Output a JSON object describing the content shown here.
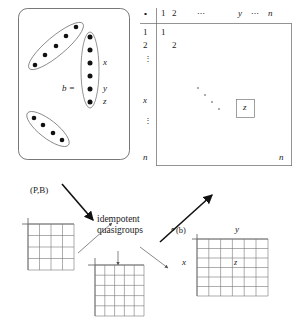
{
  "figure": {
    "colors": {
      "ink": "#1a1a1a",
      "line": "#555555",
      "grid": "#777777",
      "faint": "#999999",
      "background": "#ffffff"
    }
  },
  "left_panel": {
    "name": "point-block-design-panel",
    "b_label": "b =",
    "element_labels": {
      "x": "x",
      "y": "y",
      "z": "z"
    },
    "blocks": [
      {
        "id": "block-top",
        "dots": 5,
        "orientation": "tilted"
      },
      {
        "id": "block-b",
        "dots": 6,
        "orientation": "vertical"
      },
      {
        "id": "block-bottom",
        "dots": 4,
        "orientation": "tilted"
      }
    ],
    "caption": "(P,B)"
  },
  "right_matrix": {
    "name": "quasigroup-operation-table",
    "corner_symbol": "∘",
    "column_headers": [
      "1",
      "2",
      "⋯",
      "y",
      "⋯",
      "n"
    ],
    "row_headers": [
      "1",
      "2",
      "⋮",
      "x",
      "⋮",
      "n"
    ],
    "diagonal_entries": [
      "1",
      "2"
    ],
    "corner_entry": "n",
    "boxed_entry": "z",
    "boxed_entry_position": {
      "row": "x",
      "column": "y"
    },
    "diagonal_ellipsis": "⋱"
  },
  "center": {
    "name": "idempotent-quasigroups-label",
    "line1": "idempotent",
    "line2": "quasigroups"
  },
  "bottom_grids": [
    {
      "id": "grid-left",
      "rows": 4,
      "cols": 4,
      "label": ""
    },
    {
      "id": "grid-middle",
      "rows": 5,
      "cols": 5,
      "label": ""
    },
    {
      "id": "grid-right",
      "rows": 6,
      "cols": 6,
      "label": "∘(b)",
      "axis_row_label": "x",
      "axis_col_label": "y",
      "cell_value": "z",
      "cell_position": {
        "row": 2,
        "column": 4
      }
    }
  ],
  "arrows": [
    {
      "id": "arrow-design-to-center",
      "style": "bold",
      "from": "(P,B)",
      "to": "idempotent quasigroups"
    },
    {
      "id": "arrow-center-to-matrix",
      "style": "bold",
      "from": "idempotent quasigroups",
      "to": "operation table"
    },
    {
      "id": "arrow-grid-left-to-center",
      "style": "thin",
      "from": "grid-left",
      "to": "idempotent quasigroups"
    },
    {
      "id": "arrow-center-to-grid-middle",
      "style": "thin",
      "from": "idempotent quasigroups",
      "to": "grid-middle"
    },
    {
      "id": "arrow-center-to-grid-right",
      "style": "thin",
      "from": "idempotent quasigroups",
      "to": "grid-right"
    }
  ]
}
